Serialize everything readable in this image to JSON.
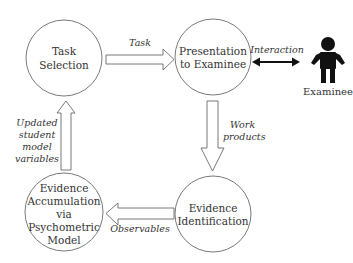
{
  "diagram": {
    "type": "cycle",
    "nodes": [
      {
        "id": "task-selection",
        "lines": [
          "Task",
          "Selection"
        ]
      },
      {
        "id": "presentation",
        "lines": [
          "Presentation",
          "to Examinee"
        ]
      },
      {
        "id": "evidence-identification",
        "lines": [
          "Evidence",
          "Identification"
        ]
      },
      {
        "id": "evidence-accumulation",
        "lines": [
          "Evidence",
          "Accumulation",
          "via",
          "Psychometric",
          "Model"
        ]
      }
    ],
    "edges": [
      {
        "from": "task-selection",
        "to": "presentation",
        "lines": [
          "Task"
        ]
      },
      {
        "from": "presentation",
        "to": "evidence-identification",
        "lines": [
          "Work",
          "products"
        ]
      },
      {
        "from": "evidence-identification",
        "to": "evidence-accumulation",
        "lines": [
          "Observables"
        ]
      },
      {
        "from": "evidence-accumulation",
        "to": "task-selection",
        "lines": [
          "Updated",
          "student",
          "model",
          "variables"
        ]
      },
      {
        "from": "presentation",
        "to": "examinee",
        "bidirectional": true,
        "lines": [
          "Interaction"
        ]
      }
    ],
    "actor": {
      "id": "examinee",
      "label": "Examinee",
      "icon": "person-icon",
      "color": "#111111"
    }
  }
}
